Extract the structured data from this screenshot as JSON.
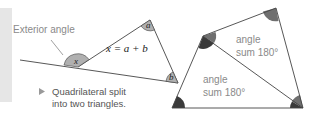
{
  "exterior_diagram": {
    "label": "Exterior angle",
    "formula": "x = a + b",
    "angles": {
      "x": "x",
      "a": "a",
      "b": "b"
    }
  },
  "caption": {
    "line1": "Quadrilateral split",
    "line2": "into two triangles."
  },
  "quadrilateral": {
    "upper_triangle_label_1": "angle",
    "upper_triangle_label_2": "sum 180°",
    "lower_triangle_label_1": "angle",
    "lower_triangle_label_2": "sum 180°"
  },
  "colors": {
    "angle_fill_light": "#a9a9a9",
    "angle_fill_mid": "#6f6f6f",
    "angle_fill_dark": "#3a3a3a",
    "line": "#444444",
    "label_gray": "#8a8a8a",
    "sidebar": "#e6e6e6"
  }
}
